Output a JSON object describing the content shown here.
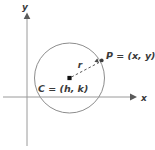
{
  "figure": {
    "background_color": "#ffffff",
    "axes": {
      "x_axis_label": "x",
      "y_axis_label": "y",
      "axis_color": "#808080",
      "x_axis_y_position": 97,
      "y_axis_x_position": 27
    },
    "circle": {
      "center_x": 69.5,
      "center_y": 78,
      "radius": 35,
      "stroke_color": "#8a8a8a",
      "fill": "none"
    },
    "center_point": {
      "label": "C = (h, k)",
      "marker": "filled-square",
      "marker_color": "#1a1a1a",
      "x": 69.5,
      "y": 78
    },
    "circumference_point": {
      "label": "P = (x, y)",
      "marker": "filled-dot",
      "marker_color": "#4a4a4a",
      "x": 102,
      "y": 60.5
    },
    "radius_segment": {
      "label": "r",
      "style": "dashed",
      "stroke_color": "#4a4a4a",
      "arrow": "to-point-P"
    }
  }
}
